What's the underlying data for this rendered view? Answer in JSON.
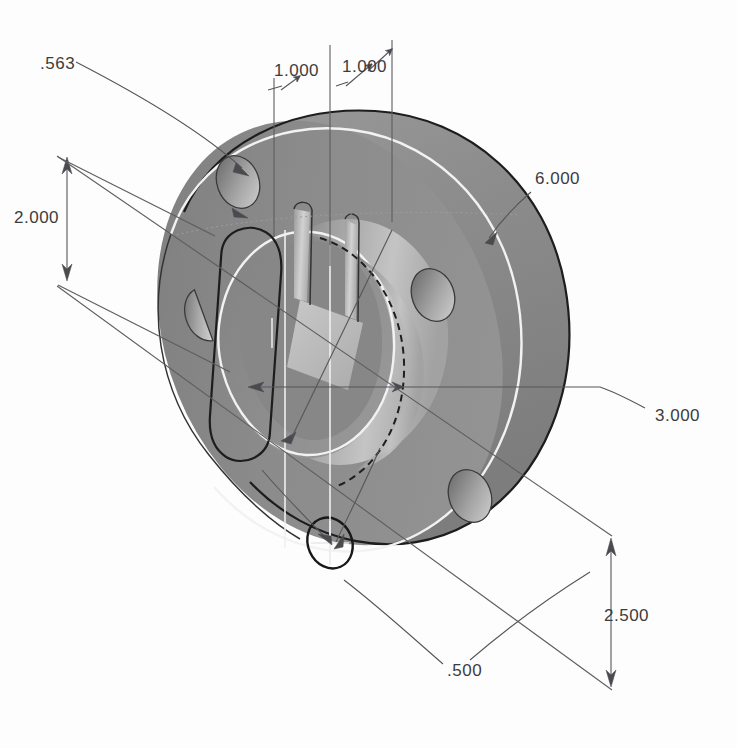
{
  "drawing": {
    "title": "Isometric shaded CAD view of a flanged hub with bolt holes, central bore and keyway slot",
    "background_color": "#fdfdfd",
    "view": "isometric",
    "units_implied": "inches"
  },
  "colors": {
    "flange_face": "#8a8a8a",
    "flange_rim": "#868686",
    "boss_face": "#8f8f8f",
    "bore_light": "#b4b4b4",
    "slot_floor": "#bcbcbc",
    "hole_shadow": "#6f6f6f",
    "hole_highlight": "#c9c9c9",
    "edge_dark": "#1d1d1d",
    "edge_highlight": "#f2f2f2",
    "dimension_line": "#55565a",
    "dimension_text": "#3c3c3c"
  },
  "dimensions": [
    {
      "id": "dim-563",
      "label": ".563",
      "text_x": 40,
      "text_y": 65,
      "type": "leader",
      "description": "bolt hole diameter callout, leader runs down-right to a flange bolt hole"
    },
    {
      "id": "dim-1000-left",
      "label": "1.000",
      "text_x": 274,
      "text_y": 72,
      "type": "linear-extension",
      "description": "horizontal offset of keyway slot, arrow points up-right"
    },
    {
      "id": "dim-1000-right",
      "label": "1.000",
      "text_x": 342,
      "text_y": 68,
      "type": "linear-extension",
      "description": "second horizontal offset, arrow points up-right"
    },
    {
      "id": "dim-6000",
      "label": "6.000",
      "text_x": 535,
      "text_y": 180,
      "type": "leader",
      "description": "outer flange diameter, leader runs down-left to the flange rim"
    },
    {
      "id": "dim-2000",
      "label": "2.000",
      "text_x": 14,
      "text_y": 219,
      "type": "linear-vertical",
      "description": "vertical dimension on the left with arrowheads at both ends"
    },
    {
      "id": "dim-3000",
      "label": "3.000",
      "text_x": 655,
      "text_y": 417,
      "type": "leader",
      "description": "bore / boss diameter, long leader crossing the part to the right"
    },
    {
      "id": "dim-2500",
      "label": "2.500",
      "text_x": 604,
      "text_y": 617,
      "type": "linear-vertical",
      "description": "vertical dimension on the lower right with arrowheads at both ends"
    },
    {
      "id": "dim-500",
      "label": ".500",
      "text_x": 447,
      "text_y": 672,
      "type": "leader",
      "description": "small hole diameter, two leaders converge on the small circle near the bottom"
    }
  ],
  "features": {
    "flange": {
      "name": "outer flange disc",
      "diameter_label": "6.000"
    },
    "boss": {
      "name": "inner raised boss",
      "diameter_label": "3.000"
    },
    "bolt_holes": {
      "name": "bolt holes on flange face",
      "count": 4,
      "diameter_label": ".563"
    },
    "small_hole": {
      "name": "small through hole",
      "diameter_label": ".500"
    },
    "keyway_slot": {
      "name": "obround keyway slot through boss",
      "width_label": "1.000"
    }
  }
}
